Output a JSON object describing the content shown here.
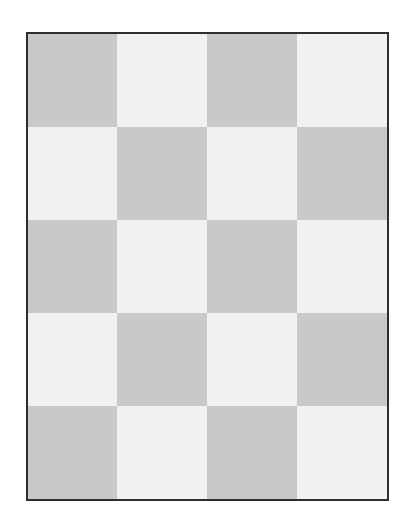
{
  "board": {
    "columns": 4,
    "rows": 5,
    "colors": {
      "dark": "#c9c9c9",
      "light": "#f1f1f1",
      "border": "#2e2e2e"
    },
    "pattern": [
      [
        "dark",
        "light",
        "dark",
        "light"
      ],
      [
        "light",
        "dark",
        "light",
        "dark"
      ],
      [
        "dark",
        "light",
        "dark",
        "light"
      ],
      [
        "light",
        "dark",
        "light",
        "dark"
      ],
      [
        "dark",
        "light",
        "dark",
        "light"
      ]
    ]
  }
}
